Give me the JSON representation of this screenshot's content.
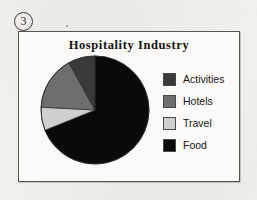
{
  "marker": {
    "number": "3",
    "shape": "circled-number"
  },
  "frame": {
    "border_color": "#57554f",
    "background_color": "#fbfaf8"
  },
  "page": {
    "background_color": "#f2f1ee"
  },
  "chart_data": {
    "type": "pie",
    "title": "Hospitality Industry",
    "xlabel": "",
    "ylabel": "",
    "legend_position": "right",
    "grid": false,
    "start_angle_deg": 0,
    "direction": "clockwise",
    "categories": [
      "Activities",
      "Hotels",
      "Travel",
      "Food"
    ],
    "values": [
      8,
      16,
      7,
      69
    ],
    "units": "percent",
    "colors": [
      "#3a3a3a",
      "#6e6e6e",
      "#cfcfcf",
      "#0a0a0a"
    ],
    "slices": [
      {
        "label": "Food",
        "value": 69,
        "color": "#0a0a0a",
        "start_deg": 0,
        "end_deg": 248
      },
      {
        "label": "Travel",
        "value": 7,
        "color": "#cfcfcf",
        "start_deg": 248,
        "end_deg": 273
      },
      {
        "label": "Hotels",
        "value": 16,
        "color": "#6e6e6e",
        "start_deg": 273,
        "end_deg": 331
      },
      {
        "label": "Activities",
        "value": 8,
        "color": "#3a3a3a",
        "start_deg": 331,
        "end_deg": 360
      }
    ]
  },
  "legend": {
    "items": [
      {
        "label": "Activities",
        "color": "#3a3a3a"
      },
      {
        "label": "Hotels",
        "color": "#6e6e6e"
      },
      {
        "label": "Travel",
        "color": "#cfcfcf"
      },
      {
        "label": "Food",
        "color": "#0a0a0a"
      }
    ]
  }
}
